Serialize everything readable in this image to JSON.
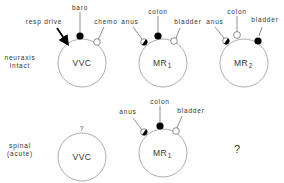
{
  "rows": {
    "intact": {
      "label_line1": "neuraxis",
      "label_line2": "intact"
    },
    "spinal": {
      "label_line1": "spinal",
      "label_line2": "(acute)"
    }
  },
  "top": {
    "vvc": {
      "name": "VVC",
      "inputs": {
        "resp": "resp drive",
        "baro": "baro",
        "chemo": "chemo"
      }
    },
    "mr1": {
      "name": "MR",
      "sub": "1",
      "inputs": {
        "anus": "anus",
        "colon": "colon",
        "bladder": "bladder"
      }
    },
    "mr2": {
      "name": "MR",
      "sub": "2",
      "inputs": {
        "anus": "anus",
        "colon": "colon",
        "bladder": "bladder"
      }
    }
  },
  "bottom": {
    "vvc": {
      "name": "VVC",
      "unknown": "?"
    },
    "mr1": {
      "name": "MR",
      "sub": "1",
      "inputs": {
        "anus": "anus",
        "colon": "colon",
        "bladder": "bladder"
      }
    },
    "mr2": {
      "unknown": "?"
    }
  },
  "colors": {
    "stroke": "#555555",
    "fill_active": "#000000",
    "fill_inactive": "#ffffff"
  }
}
